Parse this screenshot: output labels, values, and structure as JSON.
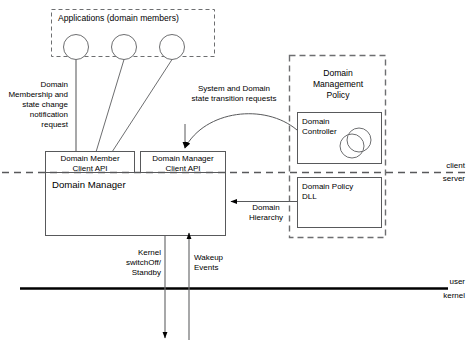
{
  "diagram": {
    "colors": {
      "stroke": "#58595b",
      "stroke_dark": "#000000",
      "text": "#000000",
      "background": "#ffffff"
    },
    "groups": {
      "applications": {
        "label": "Applications (domain members)",
        "border_style": "dashed"
      },
      "domain_management_policy": {
        "label": "Domain\nManagement\nPolicy",
        "border_style": "dashed"
      }
    },
    "boxes": {
      "domain_member_client_api": {
        "label": "Domain Member\nClient API"
      },
      "domain_manager_client_api": {
        "label": "Domain Manager\nClient API"
      },
      "domain_manager": {
        "label": "Domain Manager"
      },
      "domain_controller": {
        "label": "Domain\nController"
      },
      "domain_policy_dll": {
        "label": "Domain Policy\nDLL"
      }
    },
    "annotations": {
      "membership_request": "Domain\nMembership and\nstate change\nnotification\nrequest",
      "state_transition_requests": "System and Domain\nstate transition requests",
      "domain_hierarchy": "Domain\nHierarchy",
      "kernel_switchoff": "Kernel\nswitchOff/\nStandby",
      "wakeup_events": "Wakeup\nEvents"
    },
    "boundaries": {
      "client_server": {
        "above": "client",
        "below": "server",
        "style": "dashed"
      },
      "user_kernel": {
        "above": "user",
        "below": "kernel",
        "style": "solid-thick"
      }
    },
    "actors": {
      "count": 3,
      "shape": "circle",
      "name": "application-actor"
    }
  }
}
